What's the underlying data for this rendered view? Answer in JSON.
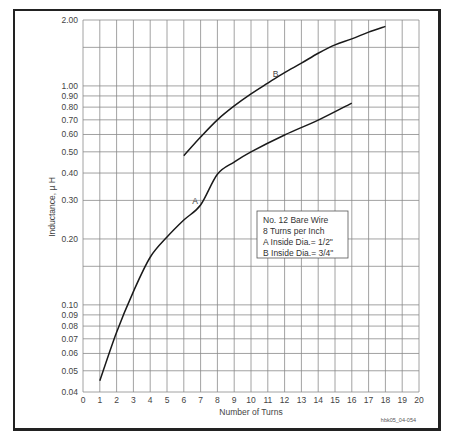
{
  "chart_data": {
    "type": "line",
    "title": "",
    "xlabel": "Number of Turns",
    "ylabel": "Inductance, µ H",
    "xlim": [
      0,
      20
    ],
    "ylim": [
      0.04,
      2.0
    ],
    "yscale": "log",
    "grid": true,
    "x_ticks": [
      "0",
      "1",
      "2",
      "3",
      "4",
      "5",
      "6",
      "7",
      "8",
      "9",
      "10",
      "11",
      "12",
      "13",
      "14",
      "15",
      "16",
      "17",
      "18",
      "19",
      "20"
    ],
    "y_ticks": [
      "2.00",
      "1.00",
      "0.90",
      "0.80",
      "0.70",
      "0.60",
      "0.50",
      "0.40",
      "0.30",
      "0.20",
      "0.10",
      "0.09",
      "0.08",
      "0.07",
      "0.06",
      "0.05",
      "0.04"
    ],
    "y_tick_values": [
      2.0,
      1.0,
      0.9,
      0.8,
      0.7,
      0.6,
      0.5,
      0.4,
      0.3,
      0.2,
      0.1,
      0.09,
      0.08,
      0.07,
      0.06,
      0.05,
      0.04
    ],
    "y_unlabeled_gridlines": [
      1.5,
      0.15
    ],
    "series": [
      {
        "name": "A",
        "x": [
          1,
          2,
          3,
          4,
          5,
          6,
          7,
          8,
          9,
          10,
          12,
          14,
          16
        ],
        "values": [
          0.045,
          0.075,
          0.115,
          0.165,
          0.204,
          0.244,
          0.286,
          0.395,
          0.449,
          0.5,
          0.597,
          0.698,
          0.835
        ]
      },
      {
        "name": "B",
        "x": [
          6,
          7,
          8,
          9,
          10,
          11,
          12,
          13,
          14,
          15,
          16,
          17,
          18
        ],
        "values": [
          0.48,
          0.584,
          0.7,
          0.81,
          0.92,
          1.03,
          1.15,
          1.27,
          1.41,
          1.54,
          1.64,
          1.76,
          1.87
        ]
      }
    ],
    "annotations": [
      {
        "text": "A",
        "x": 6.5,
        "y": 0.29
      },
      {
        "text": "B",
        "x": 11.3,
        "y": 1.1
      }
    ],
    "legend": {
      "position": "inside-right",
      "lines": [
        "No. 12 Bare Wire",
        "8 Turns per Inch",
        "A Inside Dia.= 1/2\"",
        "B Inside Dia.= 3/4\""
      ]
    }
  },
  "figure_code": "hbk05_04-054"
}
